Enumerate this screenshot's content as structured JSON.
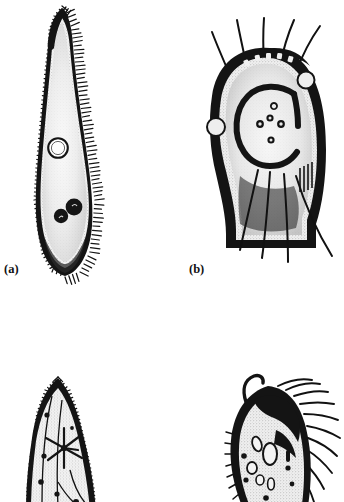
{
  "plate": {
    "kind": "scientific-illustration-plate",
    "medium": "black-and-white ink line drawings (halftone scan)",
    "background_color": "#ffffff",
    "ink_color": "#111111",
    "width_px": 344,
    "height_px": 502,
    "subject": "Protozoa: ciliates and flagellate-bearing cells",
    "panel_count_visible": 4,
    "panel_count_labeled": 2
  },
  "panels": [
    {
      "id": "a",
      "label": "(a)",
      "label_x": 4,
      "label_y": 263,
      "organism": "elongate ciliate with curved anterior neck",
      "bbox": {
        "x": 28,
        "y": 4,
        "w": 78,
        "h": 278
      },
      "features": {
        "body_shape": "slender elongate, swollen mid-body, tapering curved neck",
        "cilia": "dense short cilia fringing entire pellicle",
        "contractile_vacuole": "single clear open circle, upper body",
        "nuclei": "two solid dark round bodies, lower body",
        "cytoplasm": "stippled light grey"
      }
    },
    {
      "id": "b",
      "label": "(b)",
      "label_x": 189,
      "label_y": 263,
      "organism": "rounded cell with anterior and posterior flagella",
      "bbox": {
        "x": 205,
        "y": 18,
        "w": 132,
        "h": 262
      },
      "features": {
        "body_shape": "broad ovoid / helmet-shaped with flattened base",
        "anterior_flagella_count": 5,
        "posterior_flagella_count": 4,
        "macronucleus": "horseshoe / C-shaped dark ring, centre",
        "inner_bodies": "five small dark granules inside the ring",
        "membrane_vesicles": "two pale bumps, left margin and upper right",
        "cytoplasm": "stippled light grey"
      }
    },
    {
      "id": "c",
      "label": "",
      "organism": "ciliate, anterior half only (cropped at page edge)",
      "bbox": {
        "x": 20,
        "y": 376,
        "w": 96,
        "h": 126
      },
      "cropped": true,
      "features": {
        "body_shape": "broad lanceolate, pointed anterior",
        "cilia": "dense short cilia along both margins",
        "contractile_vacuole": "radiating star-shaped vacuole with collecting canals",
        "granules": "scattered small dark granules in cytoplasm"
      }
    },
    {
      "id": "d",
      "label": "",
      "organism": "ciliate with hooked anterior and long lateral cilia (cropped at page edge)",
      "bbox": {
        "x": 215,
        "y": 378,
        "w": 124,
        "h": 124
      },
      "cropped": true,
      "features": {
        "body_shape": "ovoid with dark anterior cap and hooked process",
        "cilia": "long stiff cilia fringing right margin",
        "anterior_hook": "single curved dark bristle at top-left",
        "vacuoles": "several pale oval food vacuoles in cytoplasm"
      }
    }
  ],
  "icons": {
    "figure_a": "protozoan-figure-a",
    "figure_b": "protozoan-figure-b",
    "figure_c": "protozoan-figure-c",
    "figure_d": "protozoan-figure-d"
  }
}
